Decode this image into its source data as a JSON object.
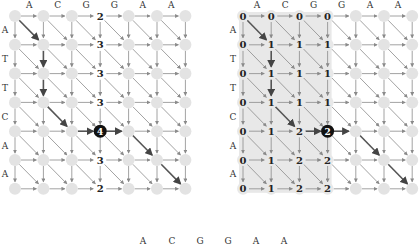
{
  "figure": {
    "left_panel": {
      "col_labels": [
        "A",
        "C",
        "G",
        "G",
        "A",
        "A"
      ],
      "row_labels": [
        "A",
        "T",
        "T",
        "C",
        "A",
        "A"
      ],
      "origin": [
        15,
        16
      ],
      "spacing": [
        28.4,
        28.8
      ],
      "values": [
        [
          null,
          null,
          null,
          "2",
          null,
          null,
          null
        ],
        [
          null,
          null,
          null,
          "3",
          null,
          null,
          null
        ],
        [
          null,
          null,
          null,
          "3",
          null,
          null,
          null
        ],
        [
          null,
          null,
          null,
          "3",
          null,
          null,
          null
        ],
        [
          null,
          null,
          null,
          "4",
          null,
          null,
          null
        ],
        [
          null,
          null,
          null,
          "3",
          null,
          null,
          null
        ],
        [
          null,
          null,
          null,
          "2",
          null,
          null,
          null
        ]
      ],
      "highlight": [
        4,
        3
      ],
      "shaded": null,
      "bold_edges": [
        {
          "from": [
            0,
            0
          ],
          "to": [
            1,
            1
          ]
        },
        {
          "from": [
            1,
            1
          ],
          "to": [
            2,
            1
          ]
        },
        {
          "from": [
            2,
            1
          ],
          "to": [
            3,
            1
          ]
        },
        {
          "from": [
            3,
            1
          ],
          "to": [
            4,
            2
          ]
        },
        {
          "from": [
            4,
            2
          ],
          "to": [
            4,
            3
          ]
        },
        {
          "from": [
            4,
            3
          ],
          "to": [
            4,
            4
          ]
        },
        {
          "from": [
            4,
            4
          ],
          "to": [
            5,
            5
          ]
        },
        {
          "from": [
            5,
            5
          ],
          "to": [
            6,
            6
          ]
        }
      ]
    },
    "right_panel": {
      "col_labels": [
        "A",
        "C",
        "G",
        "G",
        "A",
        "A"
      ],
      "row_labels": [
        "A",
        "T",
        "T",
        "C",
        "A",
        "A"
      ],
      "origin": [
        243,
        16
      ],
      "spacing": [
        28.2,
        28.8
      ],
      "values": [
        [
          "0",
          "0",
          "0",
          "0",
          null,
          null,
          null
        ],
        [
          "0",
          "1",
          "1",
          "1",
          null,
          null,
          null
        ],
        [
          "0",
          "1",
          "1",
          "1",
          null,
          null,
          null
        ],
        [
          "0",
          "1",
          "1",
          "1",
          null,
          null,
          null
        ],
        [
          "0",
          "1",
          "2",
          "2",
          null,
          null,
          null
        ],
        [
          "0",
          "1",
          "2",
          "2",
          null,
          null,
          null
        ],
        [
          "0",
          "1",
          "2",
          "2",
          null,
          null,
          null
        ]
      ],
      "highlight": [
        4,
        3
      ],
      "shaded": [
        0,
        0,
        3,
        6
      ],
      "bold_edges": [
        {
          "from": [
            0,
            0
          ],
          "to": [
            1,
            1
          ]
        },
        {
          "from": [
            1,
            1
          ],
          "to": [
            2,
            1
          ]
        },
        {
          "from": [
            2,
            1
          ],
          "to": [
            3,
            1
          ]
        },
        {
          "from": [
            3,
            1
          ],
          "to": [
            4,
            2
          ]
        },
        {
          "from": [
            4,
            2
          ],
          "to": [
            4,
            3
          ]
        },
        {
          "from": [
            4,
            3
          ],
          "to": [
            4,
            4
          ]
        },
        {
          "from": [
            4,
            4
          ],
          "to": [
            5,
            5
          ]
        },
        {
          "from": [
            5,
            5
          ],
          "to": [
            6,
            6
          ]
        }
      ]
    },
    "bottom_sequence": {
      "letters": [
        "A",
        "C",
        "G",
        "G",
        "A",
        "A"
      ],
      "x": [
        143,
        172,
        200,
        228,
        256,
        284
      ],
      "y": 244
    },
    "colors": {
      "node": "#e3e3e3",
      "edge": "#8a8a8a",
      "bold_edge": "#555555",
      "shade": "#e8e8e8",
      "highlight": "#111111"
    }
  }
}
